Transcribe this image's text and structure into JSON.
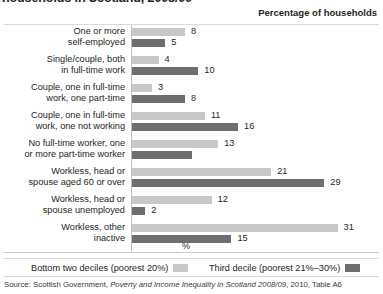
{
  "title": "households in Scotland, 2008/09",
  "column_header": "Percentage of households",
  "axis_unit_label": "%",
  "source": {
    "prefix": "Source: Scottish Government, ",
    "italic": "Poverty and Income Inequality in Scotland 2008/09",
    "suffix": ", 2010, Table A6"
  },
  "legend": [
    {
      "label": "Bottom two deciles (poorest 20%)",
      "swatch": "light",
      "color": "#c8c8c8"
    },
    {
      "label": "Third decile (poorest 21%–30%)",
      "swatch": "dark",
      "color": "#6e6e6e"
    }
  ],
  "chart_data": {
    "type": "bar",
    "orientation": "horizontal",
    "title": "households in Scotland, 2008/09",
    "xlabel": "%",
    "ylabel": "",
    "xlim": [
      0,
      31
    ],
    "grid": false,
    "legend_position": "bottom",
    "categories": [
      "One or more self-employed",
      "Single/couple, both in full-time work",
      "Couple, one in full-time work, one part-time",
      "Couple, one in full-time work, one not working",
      "No full-time worker, one or more part-time worker",
      "Workless, head or spouse aged 60 or over",
      "Workless, head or spouse unemployed",
      "Workless, other inactive"
    ],
    "category_lines": [
      [
        "One or more",
        "self-employed"
      ],
      [
        "Single/couple, both",
        "in full-time work"
      ],
      [
        "Couple, one in full-time",
        "work, one part-time"
      ],
      [
        "Couple, one in full-time",
        "work, one not working"
      ],
      [
        "No full-time worker, one",
        "or more part-time worker"
      ],
      [
        "Workless, head or",
        "spouse aged 60 or over"
      ],
      [
        "Workless, head or",
        "spouse unemployed"
      ],
      [
        "Workless, other",
        "inactive"
      ]
    ],
    "series": [
      {
        "name": "Bottom two deciles (poorest 20%)",
        "color": "#c8c8c8",
        "values": [
          8,
          4,
          3,
          11,
          13,
          21,
          12,
          31
        ],
        "labels": [
          "8",
          "4",
          "3",
          "11",
          "13",
          "21",
          "12",
          "31"
        ]
      },
      {
        "name": "Third decile (poorest 21%–30%)",
        "color": "#6e6e6e",
        "values": [
          5,
          10,
          8,
          16,
          9,
          29,
          2,
          15
        ],
        "labels": [
          "5",
          "10",
          "8",
          "16",
          "",
          "29",
          "2",
          "15"
        ]
      }
    ]
  }
}
